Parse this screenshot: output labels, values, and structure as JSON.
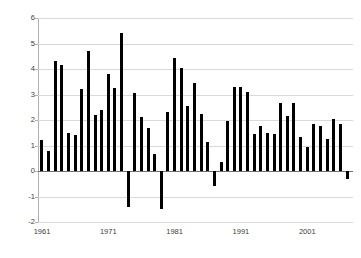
{
  "chart_data": {
    "type": "bar",
    "title": "",
    "xlabel": "",
    "ylabel": "Percentage",
    "ylim": [
      -2,
      6
    ],
    "yticks": [
      6,
      5,
      4,
      3,
      2,
      1,
      0,
      -1,
      -2
    ],
    "ytick_labels": [
      "6",
      "5",
      "4",
      "3",
      "2",
      "1",
      "0",
      "-1",
      "-2"
    ],
    "xtick_labels": [
      "1961",
      "1971",
      "1981",
      "1991",
      "2001"
    ],
    "xticks": [
      1961,
      1971,
      1981,
      1991,
      2001
    ],
    "grid": "horizontal",
    "legend": "none",
    "bar_color": "#000000",
    "categories": [
      1961,
      1962,
      1963,
      1964,
      1965,
      1966,
      1967,
      1968,
      1969,
      1970,
      1971,
      1972,
      1973,
      1974,
      1975,
      1976,
      1977,
      1978,
      1979,
      1980,
      1981,
      1982,
      1983,
      1984,
      1985,
      1986,
      1987,
      1988,
      1989,
      1990,
      1991,
      1992,
      1993,
      1994,
      1995,
      1996,
      1997,
      1998,
      1999,
      2000,
      2001,
      2002,
      2003,
      2004,
      2005,
      2006
    ],
    "values": [
      1.2,
      0.8,
      4.3,
      4.15,
      1.5,
      1.4,
      3.2,
      4.7,
      2.2,
      2.4,
      3.8,
      3.25,
      5.4,
      -1.4,
      3.05,
      2.1,
      1.7,
      0.65,
      -1.5,
      2.3,
      4.45,
      4.05,
      2.55,
      3.45,
      2.25,
      1.15,
      -0.6,
      0.35,
      1.95,
      3.3,
      3.3,
      3.1,
      1.45,
      1.75,
      1.5,
      1.45,
      2.65,
      2.15,
      2.65,
      1.35,
      0.95,
      1.85,
      1.75,
      1.25,
      2.05,
      1.85
    ],
    "final_value": -0.3
  },
  "axis": {
    "y_title": "Percentage"
  }
}
